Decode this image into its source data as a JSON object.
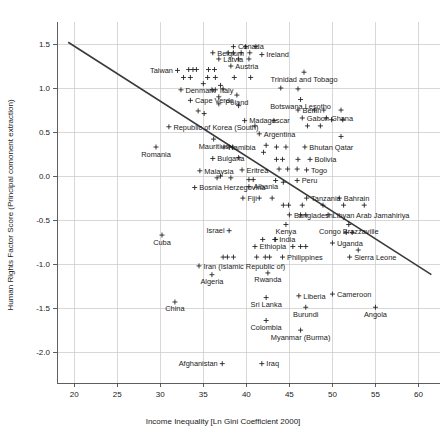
{
  "chart_data": {
    "type": "scatter",
    "title": "",
    "xlabel": "Income Inequality [Ln Gini Coefficient 2000]",
    "ylabel": "Human Rights Factor Score (Principal comonent extraction)",
    "xlim": [
      18.0,
      62.5
    ],
    "ylim": [
      -2.35,
      1.75
    ],
    "xticks": [
      20,
      25,
      30,
      35,
      40,
      45,
      50,
      55,
      60
    ],
    "xtick_labels": [
      "20",
      "25",
      "30",
      "35",
      "40",
      "45",
      "50",
      "55",
      "60"
    ],
    "yticks": [
      1.5,
      1.0,
      0.5,
      0.0,
      -0.5,
      -1.0,
      -1.5,
      -2.0
    ],
    "ytick_labels": [
      "1.5",
      "1.0",
      "0.5",
      "0.0",
      "-0.5",
      "-1.0",
      "-1.5",
      "-2.0"
    ],
    "grid": true,
    "legend": "none",
    "marker_symbol": "plus",
    "marker_color": "#1a1a1a",
    "trendline": {
      "present": true,
      "color": "#3a3a3a",
      "x_start": 19.3,
      "y_start": 1.52,
      "x_end": 61.5,
      "y_end": -1.12
    },
    "points": [
      {
        "x": 32.0,
        "y": 1.2,
        "label": "Taiwan",
        "label_pos": "left"
      },
      {
        "x": 38.5,
        "y": 1.47,
        "label": "Canada",
        "label_pos": "right"
      },
      {
        "x": 36.1,
        "y": 1.4,
        "label": "Belgium",
        "label_pos": "right"
      },
      {
        "x": 41.8,
        "y": 1.38,
        "label": "Ireland",
        "label_pos": "right"
      },
      {
        "x": 36.8,
        "y": 1.33,
        "label": "Latvia",
        "label_pos": "right"
      },
      {
        "x": 38.2,
        "y": 1.25,
        "label": "Austria",
        "label_pos": "right"
      },
      {
        "x": 32.4,
        "y": 0.98,
        "label": "Denmark",
        "label_pos": "right"
      },
      {
        "x": 36.4,
        "y": 0.98,
        "label": "Italy",
        "label_pos": "right"
      },
      {
        "x": 38.9,
        "y": 0.92,
        "label": "Poland",
        "label_pos": "below"
      },
      {
        "x": 33.5,
        "y": 0.86,
        "label": "Cape Verde",
        "label_pos": "right"
      },
      {
        "x": 46.7,
        "y": 1.18,
        "label": "Trinidad and Tobago",
        "label_pos": "below"
      },
      {
        "x": 46.3,
        "y": 0.87,
        "label": "Botswana Lesotho",
        "label_pos": "below"
      },
      {
        "x": 46.0,
        "y": 0.75,
        "label": "Benin",
        "label_pos": "right"
      },
      {
        "x": 46.5,
        "y": 0.66,
        "label": "Gabon",
        "label_pos": "right"
      },
      {
        "x": 49.3,
        "y": 0.66,
        "label": "Ghana",
        "label_pos": "right"
      },
      {
        "x": 31.0,
        "y": 0.56,
        "label": "Republic of Korea (South)",
        "label_pos": "right"
      },
      {
        "x": 29.5,
        "y": 0.33,
        "label": "Romania",
        "label_pos": "below"
      },
      {
        "x": 39.8,
        "y": 0.63,
        "label": "Madagascar",
        "label_pos": "right"
      },
      {
        "x": 41.5,
        "y": 0.48,
        "label": "Argentina",
        "label_pos": "right"
      },
      {
        "x": 36.2,
        "y": 0.42,
        "label": "Mauritius",
        "label_pos": "below"
      },
      {
        "x": 37.4,
        "y": 0.33,
        "label": "Namibia",
        "label_pos": "right"
      },
      {
        "x": 46.8,
        "y": 0.33,
        "label": "Bhutan Qatar",
        "label_pos": "right"
      },
      {
        "x": 36.1,
        "y": 0.2,
        "label": "Bulgaria",
        "label_pos": "right"
      },
      {
        "x": 47.4,
        "y": 0.19,
        "label": "Bolivia",
        "label_pos": "right"
      },
      {
        "x": 34.6,
        "y": 0.06,
        "label": "Malaysia",
        "label_pos": "right"
      },
      {
        "x": 39.5,
        "y": 0.07,
        "label": "Eritrea",
        "label_pos": "right"
      },
      {
        "x": 47.0,
        "y": 0.07,
        "label": "Togo",
        "label_pos": "right"
      },
      {
        "x": 45.9,
        "y": -0.05,
        "label": "Peru",
        "label_pos": "right"
      },
      {
        "x": 34.0,
        "y": -0.13,
        "label": "Bosnia Herzegovina",
        "label_pos": "right"
      },
      {
        "x": 40.3,
        "y": -0.12,
        "label": "Albania",
        "label_pos": "right"
      },
      {
        "x": 39.6,
        "y": -0.25,
        "label": "Fiji",
        "label_pos": "right"
      },
      {
        "x": 47.0,
        "y": -0.25,
        "label": "Tanzania",
        "label_pos": "right"
      },
      {
        "x": 50.8,
        "y": -0.25,
        "label": "Bahrain",
        "label_pos": "right"
      },
      {
        "x": 30.2,
        "y": -0.67,
        "label": "Cuba",
        "label_pos": "below"
      },
      {
        "x": 45.0,
        "y": -0.44,
        "label": "Bangladesh",
        "label_pos": "right"
      },
      {
        "x": 49.5,
        "y": -0.44,
        "label": "Libyan Arab Jamahiriya",
        "label_pos": "right"
      },
      {
        "x": 44.6,
        "y": -0.55,
        "label": "Kenya",
        "label_pos": "below"
      },
      {
        "x": 51.9,
        "y": -0.55,
        "label": "Congo Brazzaville",
        "label_pos": "below"
      },
      {
        "x": 38.0,
        "y": -0.62,
        "label": "Israel",
        "label_pos": "left"
      },
      {
        "x": 43.3,
        "y": -0.72,
        "label": "India",
        "label_pos": "right"
      },
      {
        "x": 50.0,
        "y": -0.76,
        "label": "Uganda",
        "label_pos": "right"
      },
      {
        "x": 41.0,
        "y": -0.8,
        "label": "Ethiopia",
        "label_pos": "right"
      },
      {
        "x": 34.5,
        "y": -1.02,
        "label": "Iran (Islamic Republic of)",
        "label_pos": "right"
      },
      {
        "x": 44.2,
        "y": -0.92,
        "label": "Philippines",
        "label_pos": "right"
      },
      {
        "x": 52.0,
        "y": -0.92,
        "label": "Sierra Leone",
        "label_pos": "right"
      },
      {
        "x": 36.0,
        "y": -1.12,
        "label": "Algeria",
        "label_pos": "below"
      },
      {
        "x": 42.5,
        "y": -1.1,
        "label": "Rwanda",
        "label_pos": "below"
      },
      {
        "x": 31.7,
        "y": -1.43,
        "label": "China",
        "label_pos": "below"
      },
      {
        "x": 46.1,
        "y": -1.36,
        "label": "Liberia",
        "label_pos": "right"
      },
      {
        "x": 50.0,
        "y": -1.34,
        "label": "Cameroon",
        "label_pos": "right"
      },
      {
        "x": 42.3,
        "y": -1.38,
        "label": "Sri Lanka",
        "label_pos": "below"
      },
      {
        "x": 46.9,
        "y": -1.49,
        "label": "Burundi",
        "label_pos": "below"
      },
      {
        "x": 55.0,
        "y": -1.49,
        "label": "Angola",
        "label_pos": "below"
      },
      {
        "x": 42.3,
        "y": -1.64,
        "label": "Colombia",
        "label_pos": "below"
      },
      {
        "x": 46.3,
        "y": -1.75,
        "label": "Myanmar (Burma)",
        "label_pos": "below"
      },
      {
        "x": 37.2,
        "y": -2.13,
        "label": "Afghanistan",
        "label_pos": "left"
      },
      {
        "x": 41.8,
        "y": -2.13,
        "label": "Iraq",
        "label_pos": "right"
      }
    ],
    "unlabeled_points": [
      {
        "x": 39.9,
        "y": 1.47
      },
      {
        "x": 41.1,
        "y": 1.47
      },
      {
        "x": 37.9,
        "y": 1.4
      },
      {
        "x": 38.5,
        "y": 1.4
      },
      {
        "x": 39.4,
        "y": 1.4
      },
      {
        "x": 40.4,
        "y": 1.4
      },
      {
        "x": 39.1,
        "y": 1.33
      },
      {
        "x": 40.3,
        "y": 1.33
      },
      {
        "x": 33.3,
        "y": 1.21
      },
      {
        "x": 33.8,
        "y": 1.21
      },
      {
        "x": 34.2,
        "y": 1.21
      },
      {
        "x": 35.6,
        "y": 1.21
      },
      {
        "x": 36.3,
        "y": 1.21
      },
      {
        "x": 32.7,
        "y": 1.12
      },
      {
        "x": 33.5,
        "y": 1.12
      },
      {
        "x": 35.5,
        "y": 1.12
      },
      {
        "x": 36.4,
        "y": 1.12
      },
      {
        "x": 38.6,
        "y": 1.12
      },
      {
        "x": 40.5,
        "y": 1.12
      },
      {
        "x": 35.0,
        "y": 1.05
      },
      {
        "x": 37.0,
        "y": 1.03
      },
      {
        "x": 37.3,
        "y": 0.99
      },
      {
        "x": 36.0,
        "y": 0.98
      },
      {
        "x": 44.0,
        "y": 1.0
      },
      {
        "x": 36.8,
        "y": 0.9
      },
      {
        "x": 46.0,
        "y": 0.99
      },
      {
        "x": 36.8,
        "y": 0.82
      },
      {
        "x": 39.1,
        "y": 0.8
      },
      {
        "x": 34.4,
        "y": 0.74
      },
      {
        "x": 35.1,
        "y": 0.71
      },
      {
        "x": 47.9,
        "y": 0.75
      },
      {
        "x": 49.0,
        "y": 0.75
      },
      {
        "x": 51.0,
        "y": 0.75
      },
      {
        "x": 49.9,
        "y": 0.64
      },
      {
        "x": 51.2,
        "y": 0.64
      },
      {
        "x": 47.1,
        "y": 0.57
      },
      {
        "x": 48.6,
        "y": 0.57
      },
      {
        "x": 41.0,
        "y": 0.57
      },
      {
        "x": 43.2,
        "y": 0.63
      },
      {
        "x": 51.0,
        "y": 0.45
      },
      {
        "x": 38.0,
        "y": 0.33
      },
      {
        "x": 38.4,
        "y": 0.33
      },
      {
        "x": 42.3,
        "y": 0.35
      },
      {
        "x": 43.5,
        "y": 0.33
      },
      {
        "x": 44.6,
        "y": 0.33
      },
      {
        "x": 42.0,
        "y": 0.27
      },
      {
        "x": 39.1,
        "y": 0.21
      },
      {
        "x": 43.5,
        "y": 0.19
      },
      {
        "x": 44.2,
        "y": 0.19
      },
      {
        "x": 46.0,
        "y": 0.19
      },
      {
        "x": 43.8,
        "y": 0.08
      },
      {
        "x": 44.8,
        "y": 0.08
      },
      {
        "x": 45.9,
        "y": 0.08
      },
      {
        "x": 36.6,
        "y": -0.02
      },
      {
        "x": 37.0,
        "y": 0.0
      },
      {
        "x": 38.2,
        "y": -0.02
      },
      {
        "x": 40.3,
        "y": -0.04
      },
      {
        "x": 40.8,
        "y": -0.04
      },
      {
        "x": 43.4,
        "y": -0.05
      },
      {
        "x": 44.3,
        "y": -0.07
      },
      {
        "x": 41.5,
        "y": -0.25
      },
      {
        "x": 43.0,
        "y": -0.25
      },
      {
        "x": 44.3,
        "y": -0.33
      },
      {
        "x": 44.9,
        "y": -0.33
      },
      {
        "x": 46.5,
        "y": -0.33
      },
      {
        "x": 48.9,
        "y": -0.33
      },
      {
        "x": 51.3,
        "y": -0.33
      },
      {
        "x": 53.7,
        "y": -0.33
      },
      {
        "x": 46.3,
        "y": -0.44
      },
      {
        "x": 46.9,
        "y": -0.44
      },
      {
        "x": 51.6,
        "y": -0.64
      },
      {
        "x": 52.3,
        "y": -0.64
      },
      {
        "x": 41.9,
        "y": -0.72
      },
      {
        "x": 43.4,
        "y": -0.72
      },
      {
        "x": 45.4,
        "y": -0.8
      },
      {
        "x": 46.3,
        "y": -0.8
      },
      {
        "x": 46.9,
        "y": -0.8
      },
      {
        "x": 53.0,
        "y": -0.84
      },
      {
        "x": 37.3,
        "y": -0.92
      },
      {
        "x": 37.8,
        "y": -0.92
      },
      {
        "x": 38.5,
        "y": -0.92
      },
      {
        "x": 41.2,
        "y": -0.92
      },
      {
        "x": 42.2,
        "y": -0.92
      },
      {
        "x": 42.7,
        "y": -0.92
      }
    ]
  },
  "axes": {
    "x_title": "Income Inequality [Ln Gini Coefficient 2000]",
    "y_title": "Human Rights Factor Score (Principal comonent extraction)"
  }
}
